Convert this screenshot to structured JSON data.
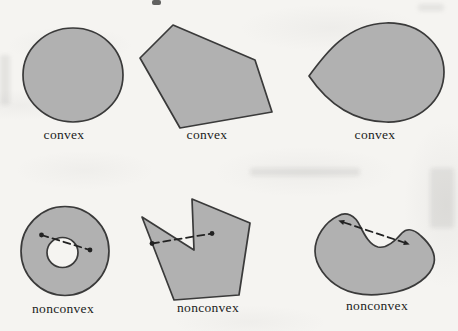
{
  "figure": {
    "shapes": [
      {
        "name": "circle",
        "label": "convex"
      },
      {
        "name": "pentagon",
        "label": "convex"
      },
      {
        "name": "teardrop",
        "label": "convex"
      },
      {
        "name": "annulus",
        "label": "nonconvex"
      },
      {
        "name": "notched-polygon",
        "label": "nonconvex"
      },
      {
        "name": "kidney",
        "label": "nonconvex"
      }
    ]
  },
  "colors": {
    "paper": "#f5f4f1",
    "shape-fill": "#b1b1b1",
    "shape-stroke": "#3a3a3a",
    "line-color": "#222222",
    "label-color": "#1c1c1c"
  }
}
